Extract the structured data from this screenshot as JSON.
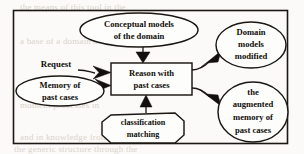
{
  "diagram": {
    "frame": {
      "x": 13,
      "y": 10,
      "width": 275,
      "height": 134
    },
    "colors": {
      "ink": "#1b1713",
      "paper": "#fbfaf8",
      "shape_fill": "#fdfdfb",
      "ghost_text": "#d9d4cc"
    },
    "nodes": [
      {
        "id": "conceptual-models",
        "shape": "ellipse",
        "lines": [
          "Conceptual models",
          "of the domain"
        ],
        "cx": 139,
        "cy": 30,
        "rx": 59,
        "ry": 17
      },
      {
        "id": "domain-models-modified",
        "shape": "ellipse",
        "lines": [
          "Domain",
          "models",
          "modified"
        ],
        "cx": 251,
        "cy": 45,
        "rx": 35,
        "ry": 23
      },
      {
        "id": "memory-of-past-cases",
        "shape": "ellipse",
        "lines": [
          "Memory of",
          "past cases"
        ],
        "cx": 60,
        "cy": 91,
        "rx": 44,
        "ry": 15
      },
      {
        "id": "reason-with-past-cases",
        "shape": "rectangle",
        "lines": [
          "Reason with",
          "past cases"
        ],
        "x": 111,
        "y": 63,
        "width": 81,
        "height": 32
      },
      {
        "id": "classification-matching",
        "shape": "octagon",
        "lines": [
          "classification",
          "matching"
        ],
        "cx": 143,
        "cy": 128,
        "rx": 41,
        "ry": 15
      },
      {
        "id": "augmented-memory",
        "shape": "ellipse",
        "lines": [
          "the",
          "augmented",
          "memory of",
          "past cases"
        ],
        "cx": 253,
        "cy": 112,
        "rx": 35,
        "ry": 30
      }
    ],
    "edges": [
      {
        "id": "request-to-reason",
        "label": "Request",
        "from": "request-source",
        "to": "reason-with-past-cases"
      },
      {
        "id": "memory-to-reason",
        "label": "",
        "from": "memory-of-past-cases",
        "to": "reason-with-past-cases"
      },
      {
        "id": "conceptual-to-reason",
        "label": "",
        "from": "conceptual-models",
        "to": "reason-with-past-cases"
      },
      {
        "id": "classification-to-reason",
        "label": "",
        "from": "classification-matching",
        "to": "reason-with-past-cases"
      },
      {
        "id": "reason-to-domain-models",
        "label": "",
        "from": "reason-with-past-cases",
        "to": "domain-models-modified"
      },
      {
        "id": "reason-to-augmented-memory",
        "label": "",
        "from": "reason-with-past-cases",
        "to": "augmented-memory"
      }
    ],
    "edge_labels": [
      {
        "id": "request-label",
        "text": "Request",
        "x": 56,
        "y": 67
      }
    ],
    "node_text": {
      "conceptual_l1": "Conceptual models",
      "conceptual_l2": "of the domain",
      "domain_l1": "Domain",
      "domain_l2": "models",
      "domain_l3": "modified",
      "memory_l1": "Memory of",
      "memory_l2": "past cases",
      "reason_l1": "Reason with",
      "reason_l2": "past cases",
      "classification_l1": "classification",
      "classification_l2": "matching",
      "augmented_l1": "the",
      "augmented_l2": "augmented",
      "augmented_l3": "memory of",
      "augmented_l4": "past cases"
    },
    "background_artifacts": [
      {
        "id": "ghost-1",
        "text": "the means of this tool in the",
        "x": 20,
        "y": 2
      },
      {
        "id": "ghost-2",
        "text": "a base of a domain of the",
        "x": 20,
        "y": 36
      },
      {
        "id": "ghost-3",
        "text": "moment processes in",
        "x": 20,
        "y": 100
      },
      {
        "id": "ghost-4",
        "text": "and in knowledge from the",
        "x": 20,
        "y": 132
      },
      {
        "id": "ghost-5",
        "text": "the generic structure through the",
        "x": 14,
        "y": 146
      }
    ]
  }
}
